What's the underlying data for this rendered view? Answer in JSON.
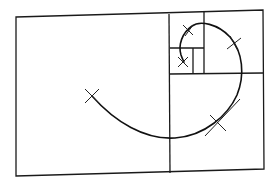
{
  "diagram": {
    "type": "golden-spiral",
    "colors": {
      "background": "#ffffff",
      "line": "#1a1a1a"
    },
    "outer_rectangle": {
      "corners": [
        [
          16,
          17
        ],
        [
          263,
          10
        ],
        [
          264,
          169
        ],
        [
          16,
          176
        ]
      ]
    },
    "dividers": [
      {
        "from": [
          169,
          14
        ],
        "to": [
          170,
          173
        ]
      },
      {
        "from": [
          170,
          74
        ],
        "to": [
          263,
          73
        ]
      },
      {
        "from": [
          204,
          12
        ],
        "to": [
          204,
          74
        ]
      },
      {
        "from": [
          170,
          48
        ],
        "to": [
          204,
          48
        ]
      },
      {
        "from": [
          193,
          48
        ],
        "to": [
          193,
          74
        ]
      }
    ],
    "markers": [
      {
        "label": "x-mark-1",
        "at": [
          92,
          96
        ]
      },
      {
        "label": "x-mark-2",
        "at": [
          217,
          122
        ]
      },
      {
        "label": "x-mark-3",
        "at": [
          234,
          44
        ]
      },
      {
        "label": "x-mark-4",
        "at": [
          189,
          30
        ]
      },
      {
        "label": "x-mark-5",
        "at": [
          183,
          62
        ]
      }
    ]
  }
}
